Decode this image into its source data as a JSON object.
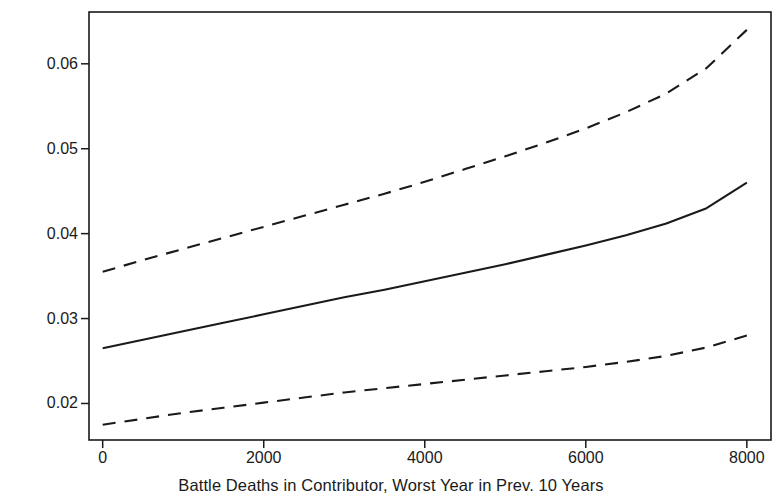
{
  "figure": {
    "title": "",
    "background_color": "#ffffff",
    "line_color": "#1a1a1a"
  },
  "axes": {
    "x": {
      "label": "Battle Deaths in Contributor, Worst Year in Prev. 10 Years",
      "tick_labels": [
        "0",
        "2000",
        "4000",
        "6000",
        "8000"
      ],
      "tick_values": [
        0,
        2000,
        4000,
        6000,
        8000
      ],
      "range": [
        -170,
        8300
      ]
    },
    "y": {
      "label": "Expected Proportion of Female Military Personnel",
      "tick_labels": [
        "0.02",
        "0.03",
        "0.04",
        "0.05",
        "0.06"
      ],
      "tick_values": [
        0.02,
        0.03,
        0.04,
        0.05,
        0.06
      ],
      "range": [
        0.0157,
        0.0661
      ]
    }
  },
  "chart_data": {
    "type": "line",
    "title": "",
    "subtitle": "",
    "xlabel": "Battle Deaths in Contributor, Worst Year in Prev. 10 Years",
    "ylabel": "Expected Proportion of Female Military Personnel",
    "xlim": [
      -170,
      8300
    ],
    "ylim": [
      0.0157,
      0.0661
    ],
    "xticks": [
      0,
      2000,
      4000,
      6000,
      8000
    ],
    "yticks": [
      0.02,
      0.03,
      0.04,
      0.05,
      0.06
    ],
    "grid": false,
    "legend": "none",
    "x": [
      0,
      500,
      1000,
      1500,
      2000,
      2500,
      3000,
      3500,
      4000,
      4500,
      5000,
      5500,
      6000,
      6500,
      7000,
      7500,
      8000
    ],
    "series": [
      {
        "name": "Upper 95% confidence bound",
        "style": "dashed",
        "color": "#1a1a1a",
        "values": [
          0.0355,
          0.0369,
          0.0382,
          0.0395,
          0.0408,
          0.0421,
          0.0434,
          0.0447,
          0.0461,
          0.0476,
          0.0491,
          0.0507,
          0.0524,
          0.0543,
          0.0565,
          0.0595,
          0.064
        ]
      },
      {
        "name": "Expected proportion (point estimate)",
        "style": "solid",
        "color": "#1a1a1a",
        "values": [
          0.0265,
          0.0275,
          0.0285,
          0.0295,
          0.0305,
          0.0315,
          0.0325,
          0.0334,
          0.0344,
          0.0354,
          0.0364,
          0.0375,
          0.0386,
          0.0398,
          0.0412,
          0.043,
          0.046
        ]
      },
      {
        "name": "Lower 95% confidence bound",
        "style": "dashed",
        "color": "#1a1a1a",
        "values": [
          0.0175,
          0.0182,
          0.0189,
          0.0195,
          0.0201,
          0.0207,
          0.0213,
          0.0218,
          0.0223,
          0.0228,
          0.0233,
          0.0238,
          0.0243,
          0.0249,
          0.0256,
          0.0266,
          0.028
        ]
      }
    ]
  }
}
